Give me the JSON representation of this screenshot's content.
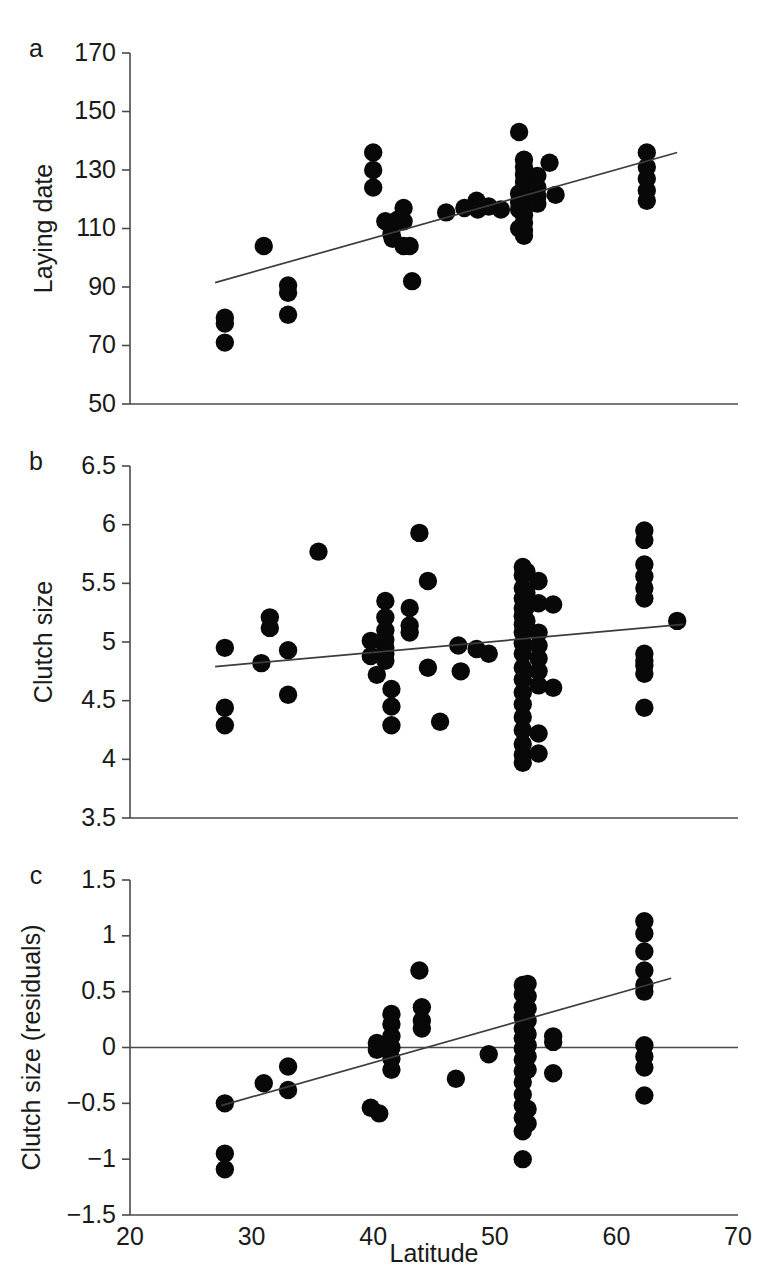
{
  "figure": {
    "background": "#ffffff",
    "point_color": "#080808",
    "line_color": "#3c3c3c",
    "axis_color": "#4a4a4a",
    "xlabel": "Latitude",
    "panel_labels": [
      "a",
      "b",
      "c"
    ]
  },
  "chart_data": [
    {
      "type": "scatter",
      "panel": "a",
      "title": "",
      "xlabel": "Latitude",
      "ylabel": "Laying date",
      "xlim": [
        20,
        70
      ],
      "ylim": [
        50,
        170
      ],
      "xticks": [
        20,
        30,
        40,
        50,
        60,
        70
      ],
      "yticks": [
        50,
        70,
        90,
        110,
        130,
        150,
        170
      ],
      "xticklabels": [
        "20",
        "30",
        "40",
        "50",
        "60",
        "70"
      ],
      "yticklabels": [
        "50",
        "70",
        "90",
        "110",
        "130",
        "150",
        "170"
      ],
      "grid": false,
      "legend": "none",
      "trendline": {
        "x": [
          27.0,
          65.0
        ],
        "y": [
          91.5,
          136.0
        ]
      },
      "points": [
        [
          27.8,
          79.5
        ],
        [
          27.8,
          77.5
        ],
        [
          27.8,
          71.0
        ],
        [
          31.0,
          104.0
        ],
        [
          33.0,
          90.5
        ],
        [
          33.0,
          88.0
        ],
        [
          33.0,
          80.5
        ],
        [
          40.0,
          136.0
        ],
        [
          40.0,
          130.0
        ],
        [
          40.0,
          124.0
        ],
        [
          41.0,
          112.5
        ],
        [
          41.5,
          111.0
        ],
        [
          41.5,
          108.0
        ],
        [
          41.6,
          106.5
        ],
        [
          42.0,
          113.0
        ],
        [
          42.5,
          117.0
        ],
        [
          42.5,
          112.5
        ],
        [
          42.5,
          104.0
        ],
        [
          43.0,
          104.0
        ],
        [
          43.2,
          92.0
        ],
        [
          46.0,
          115.5
        ],
        [
          47.5,
          117.0
        ],
        [
          48.5,
          119.5
        ],
        [
          48.6,
          116.5
        ],
        [
          49.5,
          117.5
        ],
        [
          50.5,
          116.5
        ],
        [
          52.0,
          143.0
        ],
        [
          52.4,
          133.5
        ],
        [
          52.4,
          131.0
        ],
        [
          52.4,
          128.5
        ],
        [
          52.4,
          126.0
        ],
        [
          52.4,
          123.5
        ],
        [
          52.4,
          121.0
        ],
        [
          52.4,
          119.0
        ],
        [
          52.4,
          117.0
        ],
        [
          52.4,
          114.5
        ],
        [
          52.4,
          112.0
        ],
        [
          52.4,
          109.5
        ],
        [
          52.4,
          107.5
        ],
        [
          52.0,
          122.0
        ],
        [
          52.0,
          119.0
        ],
        [
          52.0,
          116.5
        ],
        [
          52.0,
          110.0
        ],
        [
          53.5,
          128.0
        ],
        [
          53.5,
          124.0
        ],
        [
          53.5,
          121.0
        ],
        [
          53.5,
          118.5
        ],
        [
          54.5,
          132.5
        ],
        [
          55.0,
          121.5
        ],
        [
          62.5,
          136.0
        ],
        [
          62.5,
          131.0
        ],
        [
          62.5,
          127.0
        ],
        [
          62.5,
          123.0
        ],
        [
          62.5,
          119.5
        ]
      ]
    },
    {
      "type": "scatter",
      "panel": "b",
      "title": "",
      "xlabel": "Latitude",
      "ylabel": "Clutch size",
      "xlim": [
        20,
        70
      ],
      "ylim": [
        3.5,
        6.5
      ],
      "xticks": [
        20,
        30,
        40,
        50,
        60,
        70
      ],
      "yticks": [
        3.5,
        4,
        4.5,
        5,
        5.5,
        6,
        6.5
      ],
      "xticklabels": [
        "20",
        "30",
        "40",
        "50",
        "60",
        "70"
      ],
      "yticklabels": [
        "3.5",
        "4",
        "4.5",
        "5",
        "5.5",
        "6",
        "6.5"
      ],
      "grid": false,
      "legend": "none",
      "trendline": {
        "x": [
          27.0,
          65.5
        ],
        "y": [
          4.79,
          5.15
        ]
      },
      "points": [
        [
          27.8,
          4.95
        ],
        [
          27.8,
          4.44
        ],
        [
          27.8,
          4.29
        ],
        [
          30.8,
          4.82
        ],
        [
          31.5,
          5.21
        ],
        [
          31.5,
          5.12
        ],
        [
          33.0,
          4.93
        ],
        [
          33.0,
          4.55
        ],
        [
          35.5,
          5.77
        ],
        [
          39.8,
          5.01
        ],
        [
          39.8,
          4.88
        ],
        [
          40.3,
          4.72
        ],
        [
          41.0,
          5.35
        ],
        [
          41.0,
          5.21
        ],
        [
          41.0,
          5.1
        ],
        [
          41.0,
          5.02
        ],
        [
          41.0,
          4.95
        ],
        [
          41.0,
          4.9
        ],
        [
          41.0,
          4.84
        ],
        [
          41.5,
          4.6
        ],
        [
          41.5,
          4.45
        ],
        [
          41.5,
          4.29
        ],
        [
          43.0,
          5.29
        ],
        [
          43.0,
          5.14
        ],
        [
          43.0,
          5.08
        ],
        [
          43.8,
          5.93
        ],
        [
          44.5,
          5.52
        ],
        [
          44.5,
          4.78
        ],
        [
          45.5,
          4.32
        ],
        [
          47.0,
          4.97
        ],
        [
          47.2,
          4.75
        ],
        [
          48.5,
          4.94
        ],
        [
          49.5,
          4.9
        ],
        [
          52.3,
          5.64
        ],
        [
          52.3,
          5.57
        ],
        [
          52.3,
          5.46
        ],
        [
          52.3,
          5.37
        ],
        [
          52.3,
          5.29
        ],
        [
          52.3,
          5.22
        ],
        [
          52.3,
          5.15
        ],
        [
          52.3,
          5.08
        ],
        [
          52.3,
          4.99
        ],
        [
          52.3,
          4.9
        ],
        [
          52.3,
          4.78
        ],
        [
          52.3,
          4.68
        ],
        [
          52.3,
          4.57
        ],
        [
          52.3,
          4.47
        ],
        [
          52.3,
          4.36
        ],
        [
          52.3,
          4.25
        ],
        [
          52.3,
          4.13
        ],
        [
          52.3,
          4.04
        ],
        [
          52.3,
          3.97
        ],
        [
          52.6,
          5.6
        ],
        [
          52.6,
          5.42
        ],
        [
          52.6,
          5.3
        ],
        [
          52.6,
          5.18
        ],
        [
          53.6,
          5.52
        ],
        [
          53.6,
          5.33
        ],
        [
          53.6,
          5.08
        ],
        [
          53.6,
          4.97
        ],
        [
          53.6,
          4.86
        ],
        [
          53.6,
          4.75
        ],
        [
          53.6,
          4.63
        ],
        [
          53.6,
          4.22
        ],
        [
          53.6,
          4.05
        ],
        [
          54.8,
          5.32
        ],
        [
          54.8,
          4.61
        ],
        [
          62.3,
          5.95
        ],
        [
          62.3,
          5.87
        ],
        [
          62.3,
          5.66
        ],
        [
          62.3,
          5.56
        ],
        [
          62.3,
          5.46
        ],
        [
          62.3,
          5.37
        ],
        [
          62.3,
          4.9
        ],
        [
          62.3,
          4.84
        ],
        [
          62.3,
          4.8
        ],
        [
          62.3,
          4.73
        ],
        [
          62.3,
          4.44
        ],
        [
          65.0,
          5.18
        ]
      ]
    },
    {
      "type": "scatter",
      "panel": "c",
      "title": "",
      "xlabel": "Latitude",
      "ylabel": "Clutch size (residuals)",
      "xlim": [
        20,
        70
      ],
      "ylim": [
        -1.5,
        1.5
      ],
      "xticks": [
        20,
        30,
        40,
        50,
        60,
        70
      ],
      "yticks": [
        -1.5,
        -1,
        -0.5,
        0,
        0.5,
        1,
        1.5
      ],
      "xticklabels": [
        "20",
        "30",
        "40",
        "50",
        "60",
        "70"
      ],
      "yticklabels": [
        "−1.5",
        "−1",
        "−0.5",
        "0",
        "0.5",
        "1",
        "1.5"
      ],
      "grid": false,
      "legend": "none",
      "zeroline": true,
      "trendline": {
        "x": [
          27.5,
          64.5
        ],
        "y": [
          -0.52,
          0.62
        ]
      },
      "points": [
        [
          27.8,
          -0.5
        ],
        [
          27.8,
          -0.95
        ],
        [
          27.8,
          -1.09
        ],
        [
          31.0,
          -0.32
        ],
        [
          33.0,
          -0.17
        ],
        [
          33.0,
          -0.38
        ],
        [
          39.8,
          -0.54
        ],
        [
          40.5,
          -0.59
        ],
        [
          40.3,
          0.04
        ],
        [
          40.3,
          -0.02
        ],
        [
          41.5,
          0.3
        ],
        [
          41.5,
          0.21
        ],
        [
          41.5,
          0.1
        ],
        [
          41.5,
          0.0
        ],
        [
          41.5,
          -0.1
        ],
        [
          41.5,
          -0.2
        ],
        [
          43.8,
          0.69
        ],
        [
          44.0,
          0.36
        ],
        [
          44.0,
          0.24
        ],
        [
          44.0,
          0.17
        ],
        [
          46.8,
          -0.28
        ],
        [
          49.5,
          -0.06
        ],
        [
          52.3,
          0.56
        ],
        [
          52.3,
          0.48
        ],
        [
          52.3,
          0.36
        ],
        [
          52.3,
          0.27
        ],
        [
          52.3,
          0.17
        ],
        [
          52.3,
          0.08
        ],
        [
          52.3,
          -0.01
        ],
        [
          52.3,
          -0.11
        ],
        [
          52.3,
          -0.21
        ],
        [
          52.3,
          -0.31
        ],
        [
          52.3,
          -0.42
        ],
        [
          52.3,
          -0.52
        ],
        [
          52.3,
          -0.63
        ],
        [
          52.3,
          -0.75
        ],
        [
          52.3,
          -1.0
        ],
        [
          52.7,
          0.57
        ],
        [
          52.7,
          0.46
        ],
        [
          52.7,
          0.35
        ],
        [
          52.7,
          0.24
        ],
        [
          52.7,
          0.12
        ],
        [
          52.7,
          0.02
        ],
        [
          52.7,
          -0.08
        ],
        [
          52.7,
          -0.2
        ],
        [
          52.7,
          -0.55
        ],
        [
          52.7,
          -0.68
        ],
        [
          54.8,
          0.1
        ],
        [
          54.8,
          0.05
        ],
        [
          54.8,
          -0.23
        ],
        [
          62.3,
          1.13
        ],
        [
          62.3,
          1.02
        ],
        [
          62.3,
          0.86
        ],
        [
          62.3,
          0.69
        ],
        [
          62.3,
          0.56
        ],
        [
          62.3,
          0.5
        ],
        [
          62.3,
          0.02
        ],
        [
          62.3,
          -0.08
        ],
        [
          62.3,
          -0.18
        ],
        [
          62.3,
          -0.43
        ]
      ]
    }
  ]
}
